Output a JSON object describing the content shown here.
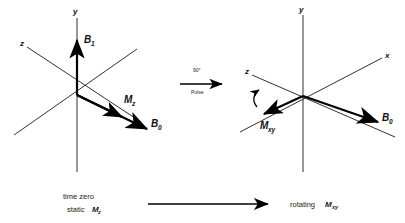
{
  "figure": {
    "ink_color": "#000000"
  },
  "left_panel": {
    "name": "time-zero-frame",
    "axes": [
      {
        "id": "y",
        "label": "y"
      },
      {
        "id": "z",
        "label": "z"
      },
      {
        "id": "x",
        "label": ""
      }
    ],
    "vectors": [
      {
        "id": "B1",
        "base": "B",
        "sub": "1"
      },
      {
        "id": "Mz",
        "base": "M",
        "sub": "z"
      },
      {
        "id": "B0",
        "base": "B",
        "sub": "0"
      }
    ],
    "caption_line1": "time zero",
    "caption_line2_prefix": "static ",
    "caption_line2_base": "M",
    "caption_line2_sub": "z"
  },
  "transition": {
    "name": "ninety-degree-pulse",
    "label_top": "90°",
    "label_bottom": "Pulse"
  },
  "right_panel": {
    "name": "rotating-frame",
    "axes": [
      {
        "id": "y",
        "label": "y"
      },
      {
        "id": "z",
        "label": "z"
      },
      {
        "id": "x",
        "label": "x"
      }
    ],
    "vectors": [
      {
        "id": "Mxy",
        "base": "M",
        "sub": "xy"
      },
      {
        "id": "B0",
        "base": "B",
        "sub": "0"
      }
    ],
    "rotation_indicator": "curved-rotation-arrow",
    "caption_prefix": "rotating ",
    "caption_base": "M",
    "caption_sub": "xy"
  },
  "bottom_arrow": {
    "name": "time-progression-arrow",
    "label": ""
  }
}
